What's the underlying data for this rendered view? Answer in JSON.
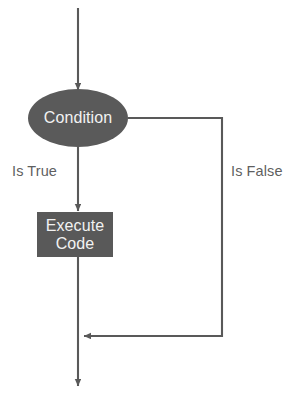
{
  "diagram": {
    "canvas": {
      "width": 299,
      "height": 400,
      "background": "#ffffff"
    },
    "colors": {
      "node_fill": "#5a5a5a",
      "node_text": "#f2f2f2",
      "line": "#595959",
      "label_text": "#5f5f5f"
    },
    "nodes": {
      "condition": {
        "shape": "ellipse",
        "label": "Condition",
        "cx": 78,
        "cy": 118,
        "rx": 50,
        "ry": 29,
        "fill": "#5a5a5a"
      },
      "execute": {
        "shape": "rectangle",
        "label_line1": "Execute",
        "label_line2": "Code",
        "x": 37,
        "y": 212,
        "width": 76,
        "height": 45,
        "fill": "#595959"
      }
    },
    "edges": [
      {
        "name": "entry-arrow",
        "label": "",
        "from": "start",
        "to": "condition"
      },
      {
        "name": "true-branch",
        "label": "Is True",
        "from": "condition",
        "to": "execute"
      },
      {
        "name": "false-branch",
        "label": "Is False",
        "from": "condition",
        "to": "merge"
      },
      {
        "name": "exit-arrow",
        "label": "",
        "from": "merge",
        "to": "end"
      }
    ],
    "labels": {
      "is_true": "Is True",
      "is_false": "Is False"
    }
  }
}
